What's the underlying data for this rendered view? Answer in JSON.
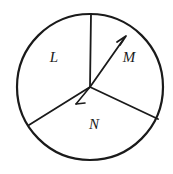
{
  "figure": {
    "type": "circle-with-three-sectors",
    "background_color": "#ffffff",
    "stroke_color": "#1a1a1a",
    "circle": {
      "center_x": 90,
      "center_y": 87,
      "radius": 73,
      "stroke_width": 2.2
    },
    "radii": [
      {
        "name": "radius-up",
        "x1": 90,
        "y1": 87,
        "x2": 91,
        "y2": 14,
        "has_arrow": false
      },
      {
        "name": "radius-lower-left",
        "x1": 90,
        "y1": 87,
        "x2": 29,
        "y2": 125,
        "has_arrow": false
      },
      {
        "name": "radius-lower-right",
        "x1": 90,
        "y1": 87,
        "x2": 158,
        "y2": 119,
        "has_arrow": false
      }
    ],
    "arrow_ray": {
      "name": "ray-toward-m",
      "x1": 90,
      "y1": 87,
      "x2": 125,
      "y2": 38,
      "has_arrow": true,
      "arrowhead_size": 7
    },
    "angle_mark": {
      "name": "angle-tick-mark",
      "x1": 90,
      "y1": 87,
      "x2": 76,
      "y2": 104,
      "tick_x1": 76,
      "tick_y1": 104,
      "tick_x2": 84,
      "tick_y2": 104
    },
    "labels": [
      {
        "text": "L",
        "x": 54,
        "y": 59
      },
      {
        "text": "M",
        "x": 129,
        "y": 59
      },
      {
        "text": "N",
        "x": 94,
        "y": 126
      }
    ]
  }
}
